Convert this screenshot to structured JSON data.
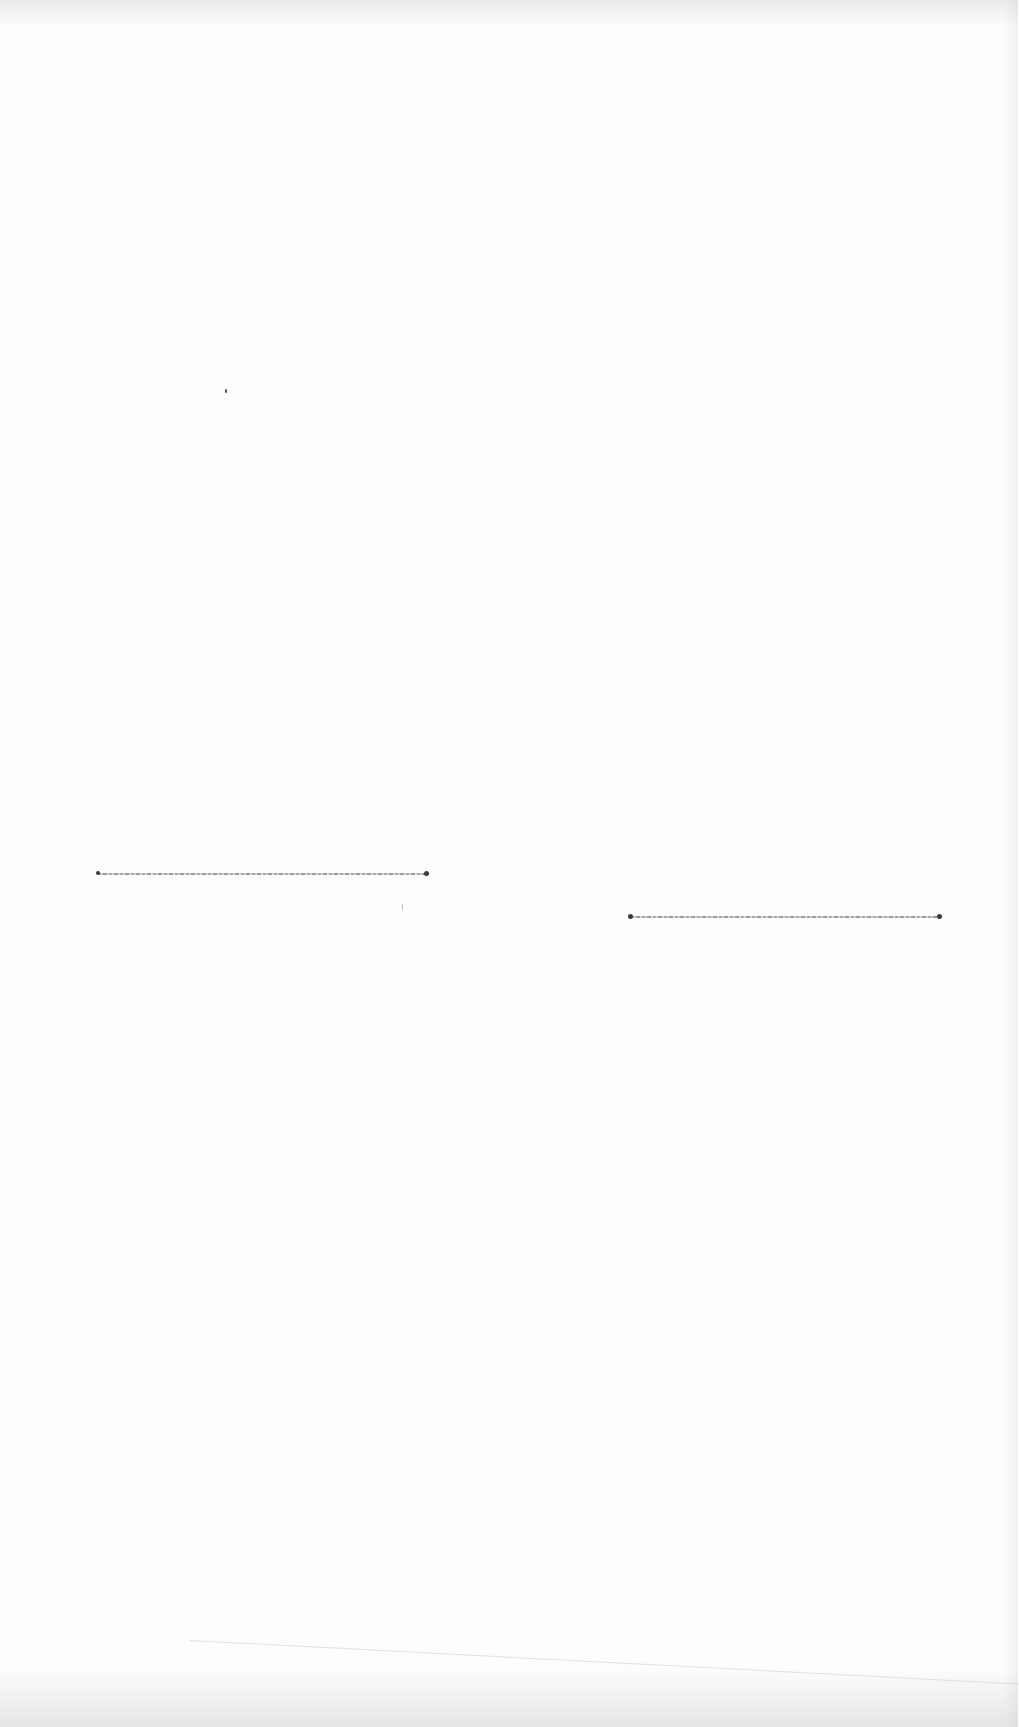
{
  "page": {
    "type": "blank scanned paper page",
    "background_color": "#fdfdfd"
  },
  "marks": [
    {
      "id": "line-1",
      "x1": 98,
      "y1": 874,
      "x2": 427,
      "y2": 873,
      "color": "#8a8a8a"
    },
    {
      "id": "line-2",
      "x1": 631,
      "y1": 917,
      "x2": 940,
      "y2": 917,
      "color": "#8a8a8a"
    }
  ]
}
